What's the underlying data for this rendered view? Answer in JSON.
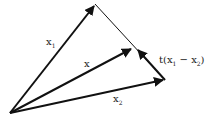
{
  "diagram": {
    "type": "vector-diagram",
    "background": "#ffffff",
    "stroke_color": "#111111",
    "labels": {
      "x1": {
        "base": "x",
        "sub": "1"
      },
      "x": {
        "base": "x"
      },
      "x2": {
        "base": "x",
        "sub": "2"
      },
      "t_expr": {
        "prefix": "t(x",
        "sub1": "1",
        "mid": " − x",
        "sub2": "2",
        "suffix": ")"
      }
    },
    "points": {
      "origin": [
        10,
        113
      ],
      "x1_tip": [
        95,
        4
      ],
      "x_tip": [
        133,
        48
      ],
      "x2_tip": [
        165,
        80
      ]
    }
  }
}
